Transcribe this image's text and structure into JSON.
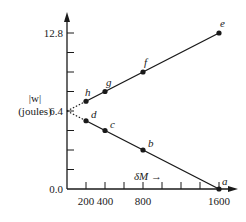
{
  "chart_data": {
    "type": "line",
    "title": "",
    "xlabel": "δM →",
    "ylabel": "|w| (joules)",
    "ylabel_lines": [
      "|w|",
      "(joules)"
    ],
    "xlim": [
      0,
      1600
    ],
    "ylim": [
      0.0,
      12.8
    ],
    "x_tick_labels": [
      "200",
      "400",
      "800",
      "1600"
    ],
    "x_ticks": [
      200,
      400,
      600,
      800,
      1000,
      1200,
      1400,
      1600
    ],
    "y_tick_labels": [
      "0.0",
      "6.4",
      "12.8"
    ],
    "y_ticks": [
      0.0,
      1.6,
      3.2,
      4.8,
      6.4,
      8.0,
      9.6,
      11.2,
      12.8
    ],
    "grid": false,
    "legend": null,
    "series": [
      {
        "name": "upper",
        "points": [
          {
            "label": "h",
            "x": 200,
            "y": 7.2
          },
          {
            "label": "g",
            "x": 400,
            "y": 8.0
          },
          {
            "label": "f",
            "x": 800,
            "y": 9.6
          },
          {
            "label": "e",
            "x": 1600,
            "y": 12.8
          }
        ],
        "extrapolation_to": {
          "x": 0,
          "y": 6.4,
          "style": "dotted"
        }
      },
      {
        "name": "lower",
        "points": [
          {
            "label": "d",
            "x": 200,
            "y": 5.6
          },
          {
            "label": "c",
            "x": 400,
            "y": 4.8
          },
          {
            "label": "b",
            "x": 800,
            "y": 3.2
          },
          {
            "label": "a",
            "x": 1600,
            "y": 0.0
          }
        ],
        "extrapolation_to": {
          "x": 0,
          "y": 6.4,
          "style": "dotted"
        }
      }
    ],
    "colors": {
      "ink": "#1a1a1a",
      "background": "#ffffff"
    }
  }
}
